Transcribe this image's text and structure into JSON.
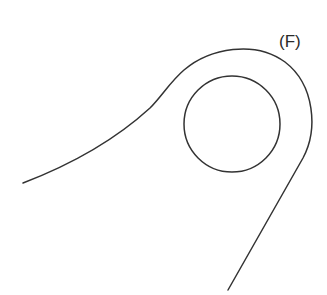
{
  "figure": {
    "label": "(F)",
    "label_position": {
      "x": 279,
      "y": 33
    },
    "stroke_color": "#333333",
    "background_color": "#ffffff",
    "shapes": {
      "inner_circle": {
        "cx": 232,
        "cy": 124,
        "r": 48
      },
      "outer_loop_path": "M 23 183 C 70 165, 115 140, 150 108 C 162 96, 170 82, 184 70 C 210 48, 255 40, 285 62 C 315 85, 318 130, 303 158 L 228 290"
    }
  }
}
